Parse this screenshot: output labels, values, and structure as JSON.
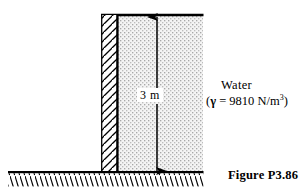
{
  "figure": {
    "caption": "Figure P3.86",
    "dimension_label": "3 m",
    "water_label": "Water",
    "gamma_prefix": "(",
    "gamma_symbol": "γ",
    "gamma_equation": " = 9810 N/m",
    "gamma_exponent": "3",
    "gamma_suffix": ")",
    "colors": {
      "line": "#000000",
      "water_fill": "#f2f2f2",
      "water_dot": "#9a9a9a",
      "wall_fill": "#ffffff",
      "hatch": "#000000",
      "background": "#ffffff"
    },
    "geometry": {
      "wall_left": 101,
      "wall_right": 118,
      "wall_top": 14,
      "water_right": 203,
      "ground_y": 172,
      "ground_left": 8,
      "dimension_x": 157
    }
  }
}
